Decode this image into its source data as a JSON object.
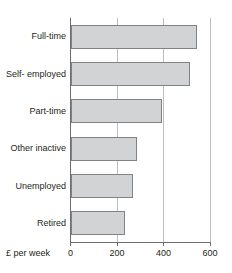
{
  "chart_data": {
    "type": "bar",
    "orientation": "horizontal",
    "title": "",
    "subtitle": "",
    "xlabel": "£ per week",
    "ylabel": "",
    "categories": [
      "Full-time",
      "Self- employed",
      "Part-time",
      "Other inactive",
      "Unemployed",
      "Retired"
    ],
    "values": [
      546,
      512,
      393,
      287,
      270,
      233
    ],
    "xlim": [
      0,
      600
    ],
    "xticks": [
      0,
      200,
      400,
      600
    ],
    "xtick_labels": [
      "0",
      "200",
      "400",
      "600"
    ],
    "grid": true,
    "grid_axis": "x",
    "legend": null,
    "series": [
      {
        "name": "£ per week",
        "values": [
          546,
          512,
          393,
          287,
          270,
          233
        ]
      }
    ],
    "colors": {
      "bar_fill": "#d2d3d5",
      "bar_stroke": "#808285",
      "axis": "#6d6e71",
      "gridline": "#bcbec0",
      "text": "#231f20",
      "background": "#ffffff"
    }
  }
}
